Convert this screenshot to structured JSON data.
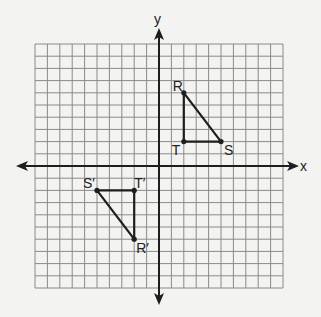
{
  "diagram": {
    "type": "coordinate-plane",
    "axes": {
      "x_label": "x",
      "y_label": "y",
      "x_range": [
        -10,
        10
      ],
      "y_range": [
        -10,
        10
      ]
    },
    "grid": {
      "cells_x": 20,
      "cells_y": 20,
      "left_px": 35,
      "top_px": 44,
      "cell_w_px": 12.4,
      "cell_h_px": 12.2,
      "line_color": "#8a8a8a",
      "background": "#f3f3f1"
    },
    "colors": {
      "axis": "#1e1e1e",
      "shape": "#1e1e1e",
      "label": "#222222"
    },
    "shapes": [
      {
        "name": "triangle-RST",
        "vertices": [
          {
            "label": "R",
            "x": 2,
            "y": 6,
            "label_dx": -11,
            "label_dy": -2
          },
          {
            "label": "S",
            "x": 5,
            "y": 2,
            "label_dx": 3,
            "label_dy": 13
          },
          {
            "label": "T",
            "x": 2,
            "y": 2,
            "label_dx": -12,
            "label_dy": 13
          }
        ]
      },
      {
        "name": "triangle-R'S'T'",
        "vertices": [
          {
            "label": "R′",
            "x": -2,
            "y": -6,
            "label_dx": 2,
            "label_dy": 14
          },
          {
            "label": "S′",
            "x": -5,
            "y": -2,
            "label_dx": -14,
            "label_dy": -2
          },
          {
            "label": "T′",
            "x": -2,
            "y": -2,
            "label_dx": 0,
            "label_dy": -2
          }
        ]
      }
    ]
  }
}
